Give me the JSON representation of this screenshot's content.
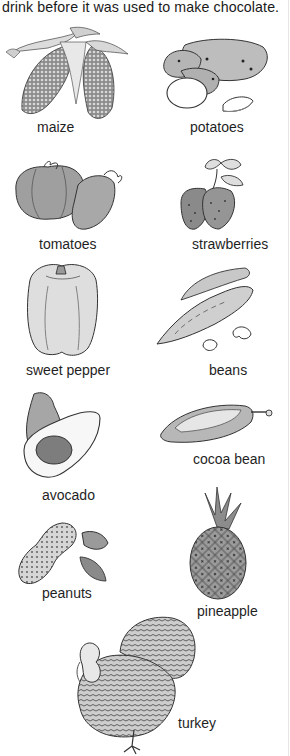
{
  "caption": {
    "text": "drink before it was used to make chocolate."
  },
  "items": [
    {
      "label": "maize",
      "icon": "maize-icon"
    },
    {
      "label": "potatoes",
      "icon": "potatoes-icon"
    },
    {
      "label": "tomatoes",
      "icon": "tomatoes-icon"
    },
    {
      "label": "strawberries",
      "icon": "strawberries-icon"
    },
    {
      "label": "sweet pepper",
      "icon": "sweet-pepper-icon"
    },
    {
      "label": "beans",
      "icon": "beans-icon"
    },
    {
      "label": "avocado",
      "icon": "avocado-icon"
    },
    {
      "label": "cocoa bean",
      "icon": "cocoa-bean-icon"
    },
    {
      "label": "peanuts",
      "icon": "peanuts-icon"
    },
    {
      "label": "pineapple",
      "icon": "pineapple-icon"
    },
    {
      "label": "turkey",
      "icon": "turkey-icon"
    }
  ],
  "colors": {
    "background": "#ffffff",
    "text": "#1a1a1a",
    "ink": "#333333",
    "shade": "#9a9a9a",
    "light_shade": "#cfcfcf"
  }
}
